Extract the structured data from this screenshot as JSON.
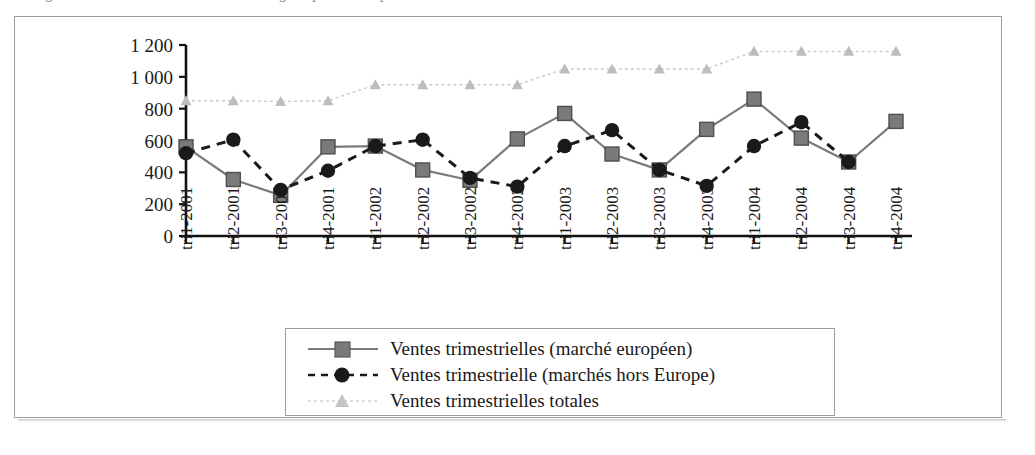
{
  "figure": {
    "caption_remnant": "Figure 4 : Ventes trimestrielles du groupe sur la période 2001-2004"
  },
  "chart_data": {
    "type": "line",
    "title": "",
    "subtitle": "",
    "xlabel": "",
    "ylabel": "",
    "ylim": [
      0,
      1200
    ],
    "yticks": [
      0,
      200,
      400,
      600,
      800,
      1000,
      1200
    ],
    "ytick_labels": [
      "0",
      "200",
      "400",
      "600",
      "800",
      "1 000",
      "1 200"
    ],
    "grid": false,
    "legend_position": "bottom",
    "categories": [
      "tri1-2001",
      "tri2-2001",
      "tri3-2001",
      "tri4-2001",
      "tri1-2002",
      "tri2-2002",
      "tri3-2002",
      "tri4-2002",
      "tri1-2003",
      "tri2-2003",
      "tri3-2003",
      "tri4-2003",
      "tri1-2004",
      "tri2-2004",
      "tri3-2004",
      "tri4-2004"
    ],
    "series": [
      {
        "name": "Ventes trimestrielles (marché européen)",
        "marker": "square",
        "line_style": "solid",
        "color": "#7a7a7a",
        "marker_color": "#7a7a7a",
        "values": [
          560,
          355,
          255,
          560,
          565,
          415,
          350,
          610,
          770,
          515,
          415,
          670,
          860,
          615,
          465,
          720
        ]
      },
      {
        "name": "Ventes trimestrielle (marchés hors Europe)",
        "marker": "circle",
        "line_style": "dashed",
        "color": "#1a1a1a",
        "marker_color": "#1a1a1a",
        "values": [
          520,
          605,
          290,
          410,
          565,
          605,
          365,
          310,
          565,
          665,
          415,
          315,
          565,
          715,
          465,
          null
        ]
      },
      {
        "name": "Ventes trimestrielles totales",
        "marker": "triangle",
        "line_style": "dotted",
        "color": "#cccccc",
        "marker_color": "#bdbdbd",
        "values": [
          850,
          850,
          845,
          850,
          950,
          950,
          950,
          950,
          1050,
          1050,
          1050,
          1050,
          1160,
          1160,
          1160,
          1160
        ]
      }
    ]
  },
  "legend": {
    "items": [
      {
        "label": "Ventes trimestrielles (marché européen)"
      },
      {
        "label": "Ventes trimestrielle (marchés hors Europe)"
      },
      {
        "label": "Ventes trimestrielles totales"
      }
    ]
  }
}
